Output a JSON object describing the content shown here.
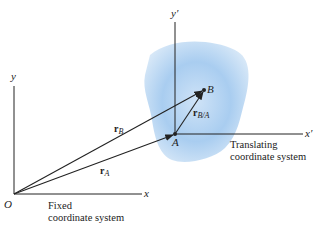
{
  "fixed_frame": {
    "origin_label": "O",
    "x_label": "x",
    "y_label": "y",
    "caption_line1": "Fixed",
    "caption_line2": "coordinate system"
  },
  "translating_frame": {
    "origin_label": "A",
    "x_label": "x′",
    "y_label": "y′",
    "caption_line1": "Translating",
    "caption_line2": "coordinate system"
  },
  "points": {
    "A": "A",
    "B": "B"
  },
  "vectors": {
    "rA": {
      "base": "r",
      "sub": "A"
    },
    "rB": {
      "base": "r",
      "sub": "B"
    },
    "rBA": {
      "base": "r",
      "sub": "B/A"
    }
  },
  "colors": {
    "body": "#a9cdf0",
    "body_edge": "#d8e9f8",
    "line": "#222222"
  }
}
